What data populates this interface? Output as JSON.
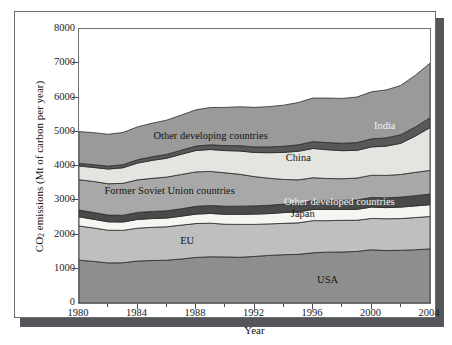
{
  "figure": {
    "frame_color": "#6a6b6f",
    "shadow_color": "#55565a",
    "background": "#ffffff"
  },
  "chart_data": {
    "type": "area",
    "stacked": true,
    "title": "",
    "subtitle": "",
    "xlabel": "Year",
    "ylabel": "CO2 emissions (Mt of carbon per year)",
    "ylabel_display": "CO",
    "ylabel_sub": "2",
    "ylabel_rest": " emissions (Mt of carbon per year)",
    "xlim": [
      1980,
      2004
    ],
    "ylim": [
      0,
      8000
    ],
    "ytick_labels": [
      "0",
      "1000",
      "2000",
      "3000",
      "4000",
      "5000",
      "6000",
      "7000",
      "8000"
    ],
    "ytick_values": [
      0,
      1000,
      2000,
      3000,
      4000,
      5000,
      6000,
      7000,
      8000
    ],
    "xtick_labels": [
      "1980",
      "1984",
      "1988",
      "1992",
      "1996",
      "2000",
      "2004"
    ],
    "xtick_values": [
      1980,
      1984,
      1988,
      1992,
      1996,
      2000,
      2004
    ],
    "xminor_values": [
      1982,
      1986,
      1990,
      1994,
      1998,
      2002
    ],
    "grid": false,
    "legend": "inline-band-labels",
    "x": [
      1980,
      1981,
      1982,
      1983,
      1984,
      1985,
      1986,
      1987,
      1988,
      1989,
      1990,
      1991,
      1992,
      1993,
      1994,
      1995,
      1996,
      1997,
      1998,
      1999,
      2000,
      2001,
      2002,
      2003,
      2004
    ],
    "series": [
      {
        "name": "USA",
        "label": "USA",
        "color": "#8e8e8e",
        "label_color": "#15150f",
        "values": [
          1250,
          1215,
          1170,
          1175,
          1225,
          1240,
          1250,
          1285,
          1330,
          1350,
          1345,
          1335,
          1360,
          1390,
          1410,
          1420,
          1465,
          1485,
          1490,
          1505,
          1555,
          1530,
          1540,
          1555,
          1580
        ]
      },
      {
        "name": "EU",
        "label": "EU",
        "color": "#bfbfbf",
        "label_color": "#15150f",
        "values": [
          1000,
          975,
          955,
          945,
          960,
          970,
          975,
          990,
          990,
          980,
          955,
          960,
          935,
          920,
          915,
          920,
          940,
          920,
          925,
          910,
          915,
          930,
          925,
          940,
          945
        ]
      },
      {
        "name": "Japan",
        "label": "Japan",
        "color": "#f5f5f2",
        "label_color": "#15150f",
        "values": [
          265,
          255,
          245,
          245,
          255,
          255,
          255,
          260,
          275,
          285,
          290,
          295,
          300,
          300,
          315,
          320,
          325,
          325,
          315,
          320,
          330,
          325,
          335,
          340,
          345
        ]
      },
      {
        "name": "Other developed countries",
        "label": "Other developed countries",
        "color": "#4a4a4a",
        "label_color": "#f4f4f0",
        "values": [
          200,
          198,
          196,
          198,
          205,
          210,
          212,
          218,
          228,
          232,
          235,
          238,
          240,
          243,
          248,
          255,
          262,
          265,
          268,
          272,
          282,
          285,
          292,
          300,
          310
        ]
      },
      {
        "name": "Former Soviet Union countries",
        "label": "Former Soviet Union countries",
        "color": "#a8a8a8",
        "label_color": "#15150f",
        "values": [
          885,
          905,
          915,
          930,
          950,
          965,
          985,
          1000,
          1005,
          995,
          975,
          930,
          855,
          790,
          720,
          680,
          665,
          640,
          630,
          640,
          650,
          655,
          660,
          680,
          690
        ]
      },
      {
        "name": "China",
        "label": "China",
        "color": "#e4e4e0",
        "label_color": "#15150f",
        "values": [
          400,
          410,
          430,
          455,
          490,
          525,
          550,
          590,
          625,
          640,
          650,
          680,
          705,
          745,
          790,
          835,
          855,
          840,
          820,
          810,
          825,
          855,
          910,
          1060,
          1250
        ]
      },
      {
        "name": "India",
        "label": "India",
        "color": "#585858",
        "label_color": "#f4f4f0",
        "values": [
          75,
          80,
          85,
          90,
          97,
          105,
          112,
          120,
          128,
          137,
          145,
          155,
          162,
          170,
          178,
          190,
          198,
          208,
          215,
          225,
          235,
          240,
          250,
          265,
          285
        ]
      },
      {
        "name": "Other developing countries",
        "label": "Other developing countries",
        "color": "#9a9a9a",
        "label_color": "#15150f",
        "values": [
          930,
          935,
          930,
          940,
          960,
          980,
          1000,
          1025,
          1060,
          1090,
          1115,
          1135,
          1155,
          1175,
          1200,
          1235,
          1275,
          1300,
          1310,
          1330,
          1375,
          1400,
          1440,
          1510,
          1595
        ]
      }
    ],
    "totals_note": "",
    "band_label_positions": [
      {
        "name": "USA",
        "x": 1997.0,
        "y": 700
      },
      {
        "name": "EU",
        "x": 1987.4,
        "y": 1850
      },
      {
        "name": "Japan",
        "x": 1995.3,
        "y": 2620
      },
      {
        "name": "Other developed countries",
        "x": 1997.8,
        "y": 2980
      },
      {
        "name": "Former Soviet Union countries",
        "x": 1986.2,
        "y": 3300
      },
      {
        "name": "China",
        "x": 1995.0,
        "y": 4250
      },
      {
        "name": "India",
        "x": 2000.9,
        "y": 5200
      },
      {
        "name": "Other developing countries",
        "x": 1989.0,
        "y": 4900
      }
    ]
  }
}
